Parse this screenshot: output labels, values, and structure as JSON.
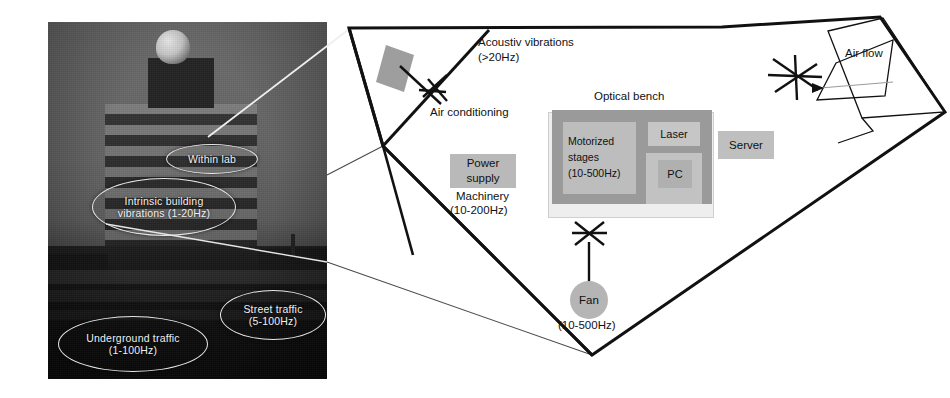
{
  "figure": {
    "type": "annotated-photo-and-floorplan-diagram"
  },
  "photo": {
    "description": "Grayscale photograph of a multi-storey laboratory building with a dome on the roof at dusk",
    "callouts": [
      {
        "id": "within-lab",
        "label": "Within lab"
      },
      {
        "id": "intrinsic-building",
        "label": "Intrinsic building\nvibrations (1-20Hz)",
        "line1": "Intrinsic building",
        "line2": "vibrations (1-20Hz)"
      },
      {
        "id": "street-traffic",
        "label": "Street traffic\n(5-100Hz)",
        "line1": "Street traffic",
        "line2": "(5-100Hz)"
      },
      {
        "id": "underground-traffic",
        "label": "Underground traffic\n(1-100Hz)",
        "line1": "Underground traffic",
        "line2": "(1-100Hz)"
      }
    ]
  },
  "diagram": {
    "room_label": "Laboratory room plan",
    "labels": {
      "acoustic_line1": "Acoustiv vibrations",
      "acoustic_line2": "(>20Hz)",
      "air_conditioning": "Air conditioning",
      "optical_bench": "Optical bench",
      "machinery_line1": "Machinery",
      "machinery_line2": "(10-200Hz)",
      "air_flow": "Air flow",
      "fan_freq": "(10-500Hz)"
    },
    "items": [
      {
        "id": "power-supply",
        "label": "Power supply",
        "line1": "Power",
        "line2": "supply",
        "color": "#b9b9b9"
      },
      {
        "id": "motorized-stages",
        "label": "Motorized stages (10-500Hz)",
        "line1": "Motorized",
        "line2": "stages",
        "line3": "(10-500Hz)",
        "color": "#bdbdbd"
      },
      {
        "id": "laser",
        "label": "Laser",
        "color": "#c6c6c6"
      },
      {
        "id": "pc",
        "label": "PC",
        "color": "#b0b0b0"
      },
      {
        "id": "server",
        "label": "Server",
        "color": "#bfbfbf"
      },
      {
        "id": "fan",
        "label": "Fan",
        "color": "#b5b5b5"
      }
    ],
    "colors": {
      "bench": "#9a9a9a",
      "bench_frame": "#eeeeee",
      "duct": "#9e9e9e",
      "wall": "#111111",
      "leader": "#333333"
    }
  }
}
